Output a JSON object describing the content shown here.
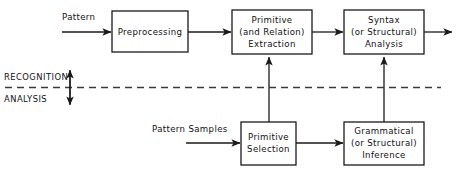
{
  "diagram": {
    "colors": {
      "background": "#ffffff",
      "stroke": "#1a1a1a",
      "divider": "#3a3a3a",
      "text": "#111111"
    },
    "boxes": [
      {
        "id": "preprocessing",
        "lines": [
          "Preprocessing"
        ]
      },
      {
        "id": "primitive-extraction",
        "lines": [
          "Primitive",
          "(and Relation)",
          "Extraction"
        ]
      },
      {
        "id": "syntax-analysis",
        "lines": [
          "Syntax",
          "(or Structural)",
          "Analysis"
        ]
      },
      {
        "id": "primitive-selection",
        "lines": [
          "Primitive",
          "Selection"
        ]
      },
      {
        "id": "grammatical-inference",
        "lines": [
          "Grammatical",
          "(or Structural)",
          "Inference"
        ]
      }
    ],
    "edge_labels": {
      "pattern": "Pattern",
      "pattern_samples": "Pattern Samples"
    },
    "zone_labels": {
      "upper": "RECOGNITION",
      "lower": "ANALYSIS"
    }
  }
}
